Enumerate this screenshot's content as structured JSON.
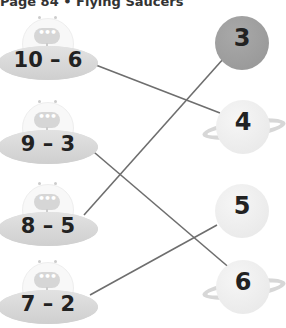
{
  "title": "Page 84 • Flying Saucers",
  "saucers": [
    {
      "expression": "10 – 6",
      "answer": 4
    },
    {
      "expression": "9 – 3",
      "answer": 6
    },
    {
      "expression": "8 – 5",
      "answer": 3
    },
    {
      "expression": "7 – 2",
      "answer": 5
    }
  ],
  "planets": [
    {
      "number": "3",
      "style": "dark"
    },
    {
      "number": "4",
      "style": "ringed"
    },
    {
      "number": "5",
      "style": "plain"
    },
    {
      "number": "6",
      "style": "ringed"
    }
  ],
  "connections": [
    {
      "from": "10 – 6",
      "to": "4"
    },
    {
      "from": "9 – 3",
      "to": "6"
    },
    {
      "from": "8 – 5",
      "to": "3"
    },
    {
      "from": "7 – 2",
      "to": "5"
    }
  ],
  "colors": {
    "line": "#6e6e6e",
    "saucer": "#d9d9d9",
    "planet_dark": "#9e9e9e",
    "planet_light": "#ececec"
  }
}
